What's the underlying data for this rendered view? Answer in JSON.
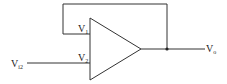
{
  "diagram": {
    "type": "op-amp circuit (voltage follower / unity feedback)",
    "stroke_color": "#333333",
    "labels": {
      "v1": {
        "base": "V",
        "sub": "1"
      },
      "v2": {
        "base": "V",
        "sub": "2"
      },
      "vi2": {
        "base": "V",
        "sub": "i2"
      },
      "vo": {
        "base": "V",
        "sub": "o"
      }
    }
  }
}
